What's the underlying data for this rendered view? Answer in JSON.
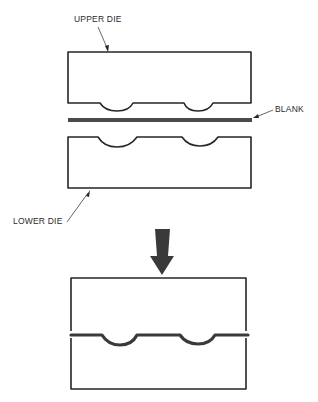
{
  "diagram": {
    "colors": {
      "line": "#262626",
      "blank": "#4a4a4a",
      "arrow": "#3a3a3a",
      "background": "#ffffff"
    },
    "labels": {
      "upper_die": "UPPER DIE",
      "blank": "BLANK",
      "lower_die": "LOWER DIE"
    },
    "stages": [
      {
        "name": "open",
        "components": [
          "upper die",
          "blank",
          "lower die"
        ]
      },
      {
        "name": "closed",
        "components": [
          "upper die",
          "formed blank",
          "lower die"
        ]
      }
    ],
    "arrow": {
      "direction": "down",
      "meaning": "die closing"
    }
  }
}
